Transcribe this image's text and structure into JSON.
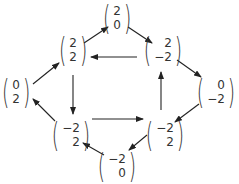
{
  "diagram": {
    "nodes": [
      {
        "id": "n20",
        "top": "2",
        "bottom": "0",
        "x": 117,
        "y": 18
      },
      {
        "id": "n22",
        "top": "2",
        "bottom": "2",
        "x": 73,
        "y": 50
      },
      {
        "id": "n2m2",
        "top": "2",
        "bottom": "−2",
        "x": 163,
        "y": 50
      },
      {
        "id": "n02",
        "top": "0",
        "bottom": "2",
        "x": 16,
        "y": 92
      },
      {
        "id": "n0m2",
        "top": "0",
        "bottom": "−2",
        "x": 216,
        "y": 92
      },
      {
        "id": "nm22L",
        "top": "−2",
        "bottom": "2",
        "x": 71,
        "y": 135
      },
      {
        "id": "nm22R",
        "top": "−2",
        "bottom": "2",
        "x": 165,
        "y": 135
      },
      {
        "id": "nm20",
        "top": "−2",
        "bottom": "0",
        "x": 117,
        "y": 166
      }
    ],
    "edges": [
      {
        "from": "n02",
        "to": "n22"
      },
      {
        "from": "n22",
        "to": "n20"
      },
      {
        "from": "n20",
        "to": "n2m2"
      },
      {
        "from": "n2m2",
        "to": "n0m2"
      },
      {
        "from": "n0m2",
        "to": "nm22R"
      },
      {
        "from": "nm22R",
        "to": "nm20"
      },
      {
        "from": "nm20",
        "to": "nm22L"
      },
      {
        "from": "nm22L",
        "to": "n02"
      },
      {
        "from": "n2m2",
        "to": "n22"
      },
      {
        "from": "n22",
        "to": "nm22L"
      },
      {
        "from": "nm22L",
        "to": "nm22R"
      },
      {
        "from": "nm22R",
        "to": "n2m2"
      }
    ],
    "colors": {
      "line": "#222222",
      "text": "#333333",
      "background": "#ffffff"
    }
  }
}
